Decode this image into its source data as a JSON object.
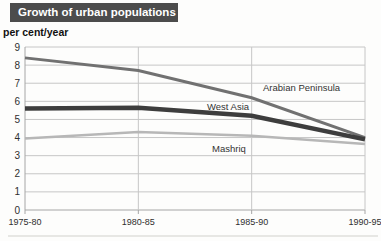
{
  "header": {
    "title": "Growth of urban populations"
  },
  "axis": {
    "unit_label": "per cent/year"
  },
  "chart_data": {
    "type": "line",
    "title": "Growth of urban populations",
    "ylabel": "per cent/year",
    "xlabel": "",
    "categories": [
      "1975-80",
      "1980-85",
      "1985-90",
      "1990-95"
    ],
    "series": [
      {
        "name": "Arabian Peninsula",
        "values": [
          8.4,
          7.7,
          6.2,
          4.0
        ],
        "color": "#717171",
        "width": 3,
        "label_x": 263,
        "label_y": 91
      },
      {
        "name": "West Asia",
        "values": [
          5.6,
          5.65,
          5.2,
          3.9
        ],
        "color": "#3d3d3d",
        "width": 4.5,
        "label_x": 207,
        "label_y": 110
      },
      {
        "name": "Mashriq",
        "values": [
          3.95,
          4.3,
          4.1,
          3.65
        ],
        "color": "#b7b7b7",
        "width": 2.5,
        "label_x": 212,
        "label_y": 152
      }
    ],
    "ylim": [
      0,
      9
    ],
    "yticks": [
      0,
      1,
      2,
      3,
      4,
      5,
      6,
      7,
      8,
      9
    ],
    "grid": true,
    "legend_position": "inline-labels"
  },
  "colors": {
    "title_bar_bg": "#4c4c4c",
    "title_text": "#ffffff",
    "grid": "#c6c6c6",
    "axis": "#a6a6a6",
    "tick_text": "#2f2f2f",
    "label_text": "#333333",
    "artifact": "#e7e7e4"
  }
}
